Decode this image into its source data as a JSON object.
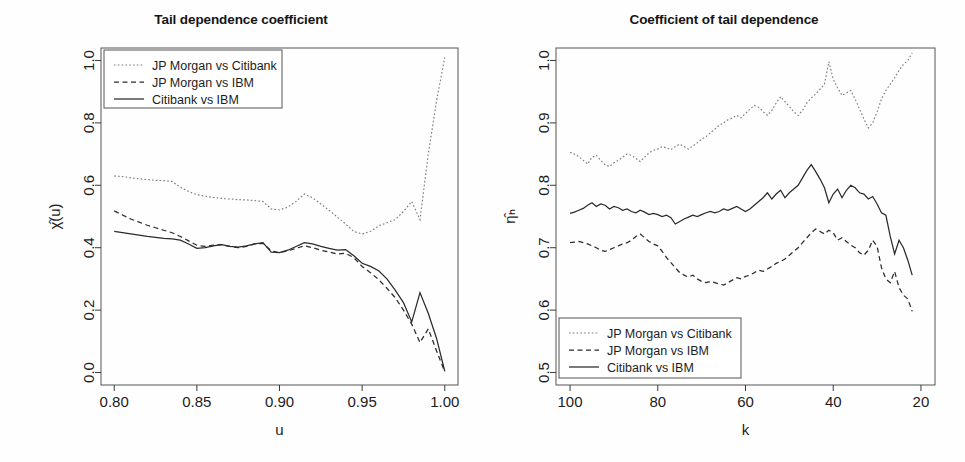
{
  "figure": {
    "background": "#fefefe",
    "ink": "#1a1a1a",
    "width": 965,
    "height": 462
  },
  "panels": [
    {
      "id": "left",
      "title": "Tail dependence coefficient",
      "xlabel": "u",
      "ylabel": "χ̂(u)",
      "xticks": [
        "0.80",
        "0.85",
        "0.90",
        "0.95",
        "1.00"
      ],
      "yticks": [
        "0.0",
        "0.2",
        "0.4",
        "0.6",
        "0.8",
        "1.0"
      ],
      "legend": {
        "position": "top-left",
        "items": [
          {
            "label": "JP Morgan vs Citibank",
            "style": "dotted",
            "color": "#7a7a7a"
          },
          {
            "label": "JP Morgan vs IBM",
            "style": "dashed",
            "color": "#2b2b2b"
          },
          {
            "label": "Citibank vs IBM",
            "style": "solid",
            "color": "#2b2b2b"
          }
        ]
      }
    },
    {
      "id": "right",
      "title": "Coefficient of tail dependence",
      "xlabel": "k",
      "ylabel": "η̂ₕ",
      "xticks": [
        "100",
        "80",
        "60",
        "40",
        "20"
      ],
      "yticks": [
        "0.5",
        "0.6",
        "0.7",
        "0.8",
        "0.9",
        "1.0"
      ],
      "legend": {
        "position": "bottom-left",
        "items": [
          {
            "label": "JP Morgan vs Citibank",
            "style": "dotted",
            "color": "#7a7a7a"
          },
          {
            "label": "JP Morgan vs IBM",
            "style": "dashed",
            "color": "#2b2b2b"
          },
          {
            "label": "Citibank vs IBM",
            "style": "solid",
            "color": "#2b2b2b"
          }
        ]
      }
    }
  ],
  "chart_data": [
    {
      "type": "line",
      "title": "Tail dependence coefficient",
      "xlabel": "u",
      "ylabel": "χ̂(u)",
      "xlim": [
        0.8,
        1.0
      ],
      "ylim": [
        0.0,
        1.0
      ],
      "xticks": [
        0.8,
        0.85,
        0.9,
        0.95,
        1.0
      ],
      "yticks": [
        0.0,
        0.2,
        0.4,
        0.6,
        0.8,
        1.0
      ],
      "grid": false,
      "legend_position": "top-left",
      "x": [
        0.8,
        0.805,
        0.81,
        0.815,
        0.82,
        0.825,
        0.83,
        0.835,
        0.84,
        0.845,
        0.85,
        0.855,
        0.86,
        0.865,
        0.87,
        0.875,
        0.88,
        0.885,
        0.89,
        0.895,
        0.9,
        0.905,
        0.91,
        0.915,
        0.92,
        0.925,
        0.93,
        0.935,
        0.94,
        0.945,
        0.95,
        0.955,
        0.96,
        0.965,
        0.97,
        0.975,
        0.98,
        0.985,
        0.99,
        0.995,
        1.0
      ],
      "series": [
        {
          "name": "JP Morgan vs Citibank",
          "style": "dotted",
          "color": "#7a7a7a",
          "values": [
            0.63,
            0.628,
            0.624,
            0.621,
            0.618,
            0.616,
            0.615,
            0.612,
            0.594,
            0.58,
            0.57,
            0.565,
            0.561,
            0.558,
            0.556,
            0.554,
            0.553,
            0.551,
            0.548,
            0.524,
            0.521,
            0.53,
            0.548,
            0.572,
            0.56,
            0.54,
            0.52,
            0.498,
            0.476,
            0.452,
            0.444,
            0.452,
            0.47,
            0.48,
            0.49,
            0.516,
            0.548,
            0.49,
            0.7,
            0.87,
            1.01
          ]
        },
        {
          "name": "JP Morgan vs IBM",
          "style": "dashed",
          "color": "#2b2b2b",
          "values": [
            0.518,
            0.505,
            0.492,
            0.482,
            0.472,
            0.464,
            0.456,
            0.448,
            0.436,
            0.422,
            0.408,
            0.404,
            0.408,
            0.41,
            0.404,
            0.4,
            0.404,
            0.412,
            0.414,
            0.39,
            0.384,
            0.39,
            0.398,
            0.406,
            0.4,
            0.392,
            0.386,
            0.38,
            0.382,
            0.368,
            0.34,
            0.32,
            0.298,
            0.27,
            0.24,
            0.2,
            0.155,
            0.096,
            0.14,
            0.07,
            0.002
          ]
        },
        {
          "name": "Citibank vs IBM",
          "style": "solid",
          "color": "#2b2b2b",
          "values": [
            0.452,
            0.448,
            0.444,
            0.44,
            0.436,
            0.433,
            0.43,
            0.428,
            0.424,
            0.412,
            0.398,
            0.4,
            0.406,
            0.41,
            0.404,
            0.402,
            0.406,
            0.412,
            0.416,
            0.386,
            0.384,
            0.392,
            0.404,
            0.416,
            0.412,
            0.404,
            0.398,
            0.392,
            0.394,
            0.374,
            0.35,
            0.34,
            0.326,
            0.3,
            0.264,
            0.224,
            0.162,
            0.256,
            0.19,
            0.11,
            0.004
          ]
        }
      ]
    },
    {
      "type": "line",
      "title": "Coefficient of tail dependence",
      "xlabel": "k",
      "ylabel": "η̂ₕ",
      "xlim": [
        100,
        20
      ],
      "ylim": [
        0.5,
        1.0
      ],
      "xticks": [
        100,
        80,
        60,
        40,
        20
      ],
      "yticks": [
        0.5,
        0.6,
        0.7,
        0.8,
        0.9,
        1.0
      ],
      "grid": false,
      "legend_position": "bottom-left",
      "x": [
        100,
        99,
        98,
        97,
        96,
        95,
        94,
        93,
        92,
        91,
        90,
        89,
        88,
        87,
        86,
        85,
        84,
        83,
        82,
        81,
        80,
        79,
        78,
        77,
        76,
        75,
        74,
        73,
        72,
        71,
        70,
        69,
        68,
        67,
        66,
        65,
        64,
        63,
        62,
        61,
        60,
        59,
        58,
        57,
        56,
        55,
        54,
        53,
        52,
        51,
        50,
        49,
        48,
        47,
        46,
        45,
        44,
        43,
        42,
        41,
        40,
        39,
        38,
        37,
        36,
        35,
        34,
        33,
        32,
        31,
        30,
        29,
        28,
        27,
        26,
        25,
        24,
        23,
        22
      ],
      "series": [
        {
          "name": "JP Morgan vs Citibank",
          "style": "dotted",
          "color": "#7a7a7a",
          "values": [
            0.853,
            0.85,
            0.846,
            0.84,
            0.834,
            0.845,
            0.848,
            0.84,
            0.833,
            0.83,
            0.836,
            0.84,
            0.845,
            0.85,
            0.848,
            0.843,
            0.838,
            0.845,
            0.852,
            0.856,
            0.858,
            0.862,
            0.86,
            0.857,
            0.862,
            0.866,
            0.862,
            0.858,
            0.863,
            0.868,
            0.874,
            0.878,
            0.884,
            0.89,
            0.896,
            0.9,
            0.905,
            0.908,
            0.912,
            0.908,
            0.915,
            0.922,
            0.928,
            0.925,
            0.918,
            0.912,
            0.92,
            0.932,
            0.942,
            0.934,
            0.926,
            0.918,
            0.912,
            0.92,
            0.932,
            0.94,
            0.946,
            0.954,
            0.962,
            0.998,
            0.97,
            0.956,
            0.944,
            0.948,
            0.952,
            0.938,
            0.922,
            0.906,
            0.892,
            0.9,
            0.918,
            0.938,
            0.952,
            0.962,
            0.972,
            0.984,
            0.994,
            1.0,
            1.012
          ]
        },
        {
          "name": "JP Morgan vs IBM",
          "style": "dashed",
          "color": "#2b2b2b",
          "values": [
            0.708,
            0.709,
            0.71,
            0.708,
            0.706,
            0.703,
            0.7,
            0.696,
            0.694,
            0.697,
            0.7,
            0.703,
            0.706,
            0.708,
            0.712,
            0.718,
            0.722,
            0.716,
            0.71,
            0.706,
            0.703,
            0.694,
            0.684,
            0.676,
            0.668,
            0.66,
            0.656,
            0.653,
            0.656,
            0.65,
            0.646,
            0.644,
            0.646,
            0.644,
            0.642,
            0.64,
            0.644,
            0.648,
            0.652,
            0.65,
            0.654,
            0.656,
            0.66,
            0.664,
            0.662,
            0.666,
            0.67,
            0.675,
            0.678,
            0.682,
            0.688,
            0.694,
            0.7,
            0.708,
            0.716,
            0.724,
            0.73,
            0.726,
            0.722,
            0.728,
            0.724,
            0.712,
            0.716,
            0.71,
            0.704,
            0.7,
            0.692,
            0.688,
            0.696,
            0.712,
            0.702,
            0.668,
            0.65,
            0.644,
            0.662,
            0.636,
            0.624,
            0.618,
            0.598
          ]
        },
        {
          "name": "Citibank vs IBM",
          "style": "solid",
          "color": "#2b2b2b",
          "values": [
            0.755,
            0.757,
            0.76,
            0.763,
            0.768,
            0.772,
            0.766,
            0.77,
            0.768,
            0.762,
            0.766,
            0.764,
            0.76,
            0.762,
            0.758,
            0.756,
            0.76,
            0.757,
            0.753,
            0.755,
            0.753,
            0.75,
            0.752,
            0.748,
            0.738,
            0.742,
            0.746,
            0.749,
            0.752,
            0.75,
            0.753,
            0.756,
            0.758,
            0.756,
            0.758,
            0.762,
            0.76,
            0.763,
            0.766,
            0.762,
            0.758,
            0.762,
            0.768,
            0.774,
            0.78,
            0.788,
            0.778,
            0.786,
            0.792,
            0.78,
            0.788,
            0.794,
            0.8,
            0.812,
            0.824,
            0.833,
            0.822,
            0.81,
            0.796,
            0.772,
            0.786,
            0.794,
            0.78,
            0.792,
            0.8,
            0.796,
            0.788,
            0.786,
            0.778,
            0.782,
            0.77,
            0.756,
            0.752,
            0.718,
            0.69,
            0.712,
            0.7,
            0.68,
            0.656
          ]
        }
      ]
    }
  ]
}
